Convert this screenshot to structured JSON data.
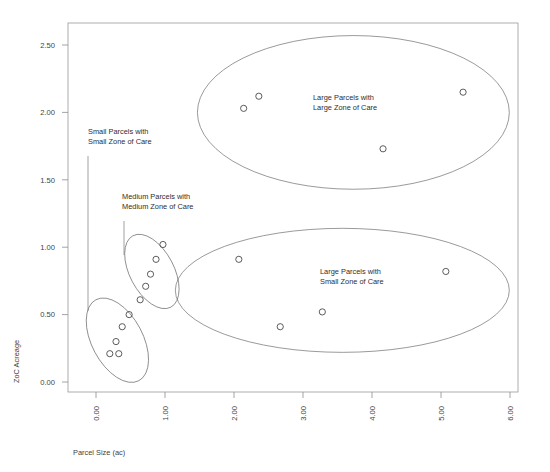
{
  "chart_data": {
    "type": "scatter",
    "title": "",
    "xlabel": "Parcel Size (ac)",
    "ylabel": "ZoC Acreage",
    "xlim": [
      -0.4,
      6.15
    ],
    "ylim": [
      -0.2,
      2.75
    ],
    "grid": false,
    "legend": "none",
    "xticks": [
      "0.00",
      "1.00",
      "2.00",
      "3.00",
      "4.00",
      "5.00",
      "6.00"
    ],
    "xtick_values": [
      0,
      1,
      2,
      3,
      4,
      5,
      6
    ],
    "yticks": [
      "0.00",
      "0.50",
      "1.00",
      "1.50",
      "2.00",
      "2.50"
    ],
    "ytick_values": [
      0,
      0.5,
      1.0,
      1.5,
      2.0,
      2.5
    ],
    "marker_style": "open-circle",
    "marker_color": "#4a4a4a",
    "series": [
      {
        "name": "Small Parcels with Small Zone of Care",
        "points": [
          {
            "x": 0.48,
            "y": 0.5
          },
          {
            "x": 0.38,
            "y": 0.41
          },
          {
            "x": 0.29,
            "y": 0.3
          },
          {
            "x": 0.2,
            "y": 0.21
          },
          {
            "x": 0.33,
            "y": 0.21
          }
        ]
      },
      {
        "name": "Medium Parcels with Medium Zone of Care",
        "points": [
          {
            "x": 0.97,
            "y": 1.02
          },
          {
            "x": 0.87,
            "y": 0.91
          },
          {
            "x": 0.79,
            "y": 0.8
          },
          {
            "x": 0.72,
            "y": 0.71
          },
          {
            "x": 0.64,
            "y": 0.61
          }
        ]
      },
      {
        "name": "Large Parcels with Large Zone of Care",
        "points": [
          {
            "x": 2.14,
            "y": 2.03
          },
          {
            "x": 2.36,
            "y": 2.12
          },
          {
            "x": 4.16,
            "y": 1.73
          },
          {
            "x": 5.32,
            "y": 2.15
          }
        ]
      },
      {
        "name": "Large Parcels with Small Zone of Care",
        "points": [
          {
            "x": 2.07,
            "y": 0.91
          },
          {
            "x": 5.07,
            "y": 0.82
          },
          {
            "x": 3.28,
            "y": 0.52
          },
          {
            "x": 2.67,
            "y": 0.41
          }
        ]
      }
    ],
    "clusters": [
      {
        "name": "small-parcels-small-zoc",
        "cx": 0.31,
        "cy": 0.31,
        "rx": 0.37,
        "ry": 0.34,
        "rotate": -28
      },
      {
        "name": "medium-parcels-medium-zoc",
        "cx": 0.81,
        "cy": 0.82,
        "rx": 0.32,
        "ry": 0.3,
        "rotate": -28
      },
      {
        "name": "large-parcels-large-zoc",
        "cx": 3.73,
        "cy": 2.0,
        "rx": 2.26,
        "ry": 0.57,
        "rotate": 0
      },
      {
        "name": "large-parcels-small-zoc",
        "cx": 3.57,
        "cy": 0.68,
        "rx": 2.42,
        "ry": 0.46,
        "rotate": 0
      }
    ],
    "annotations": [
      {
        "id": "small-parcels-annotation",
        "line1": "Small Parcels with",
        "line2": "Small Zone of Care",
        "text_x": 88,
        "text_y": 134,
        "leader": {
          "x1": 88,
          "y1": 156,
          "x2": 88,
          "y2": 311
        }
      },
      {
        "id": "medium-parcels-annotation",
        "line1": "Medium Parcels with",
        "line2": "Medium Zone of Care",
        "text_x": 122,
        "text_y": 199,
        "leader": {
          "x1": 124,
          "y1": 221,
          "x2": 124,
          "y2": 255
        }
      },
      {
        "id": "large-large-annotation",
        "line1": "Large Parcels with",
        "line2": "Large Zone of Care",
        "text_x": 313,
        "text_y": 100,
        "leader": null
      },
      {
        "id": "large-small-annotation",
        "line1": "Large Parcels with",
        "line2": "Small Zone of Care",
        "text_x": 320,
        "text_y": 274,
        "leader": null
      }
    ]
  },
  "axes": {
    "x_title": "Parcel Size (ac)",
    "y_title": "ZoC Acreage"
  }
}
